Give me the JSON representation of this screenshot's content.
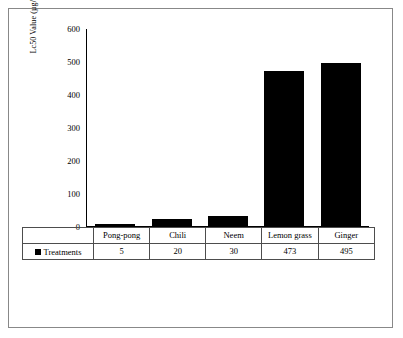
{
  "chart_data": {
    "type": "bar",
    "title": "",
    "xlabel": "",
    "ylabel": "Lc50 Value (µg/ml)",
    "categories": [
      "Pong-pong",
      "Chili",
      "Neem",
      "Lemon grass",
      "Ginger"
    ],
    "series": [
      {
        "name": "Treatments",
        "values": [
          5,
          20,
          30,
          473,
          495
        ]
      }
    ],
    "ylim": [
      0,
      600
    ],
    "yticks": [
      0,
      100,
      200,
      300,
      400,
      500,
      600
    ],
    "ytick_labels": [
      "0",
      "100",
      "200",
      "300",
      "400",
      "500",
      "600"
    ],
    "grid": false,
    "legend": {
      "position": "table-left",
      "entries": [
        "Treatments"
      ]
    },
    "bar_color": "#000000"
  },
  "table": {
    "row_label": "Treatments",
    "headers": [
      "Pong-pong",
      "Chili",
      "Neem",
      "Lemon grass",
      "Ginger"
    ],
    "values": [
      "5",
      "20",
      "30",
      "473",
      "495"
    ]
  }
}
